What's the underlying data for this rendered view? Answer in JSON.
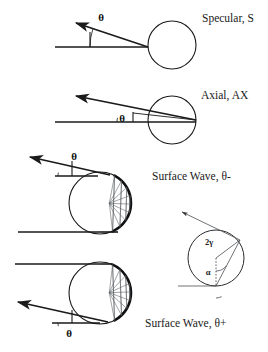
{
  "figure": {
    "background_color": "#ffffff",
    "ink_color": "#1a1a1a",
    "chord_color": "#555a5e",
    "width": 268,
    "height": 352
  },
  "panels": [
    {
      "id": "specular",
      "label": "Specular, S",
      "angle_label": "θ",
      "circle": {
        "cx": 172,
        "cy": 45,
        "r": 24
      },
      "label_pos": {
        "x": 202,
        "y": 22
      },
      "angle_label_pos": {
        "x": 101,
        "y": 21
      },
      "baseline": {
        "x1": 55,
        "y1": 47,
        "x2": 148,
        "y2": 47
      },
      "incident_ray": {
        "x1": 55,
        "y1": 47,
        "x2": 148,
        "y2": 47
      },
      "scattered_ray": {
        "x1": 148,
        "y1": 47,
        "x2": 76,
        "y2": 23
      },
      "angle_arc": {
        "cx": 148,
        "cy": 47,
        "r": 58,
        "start_deg": 180,
        "end_deg": 162
      },
      "vertical_tick": {
        "x1": 90,
        "y1": 47,
        "x2": 90,
        "y2": 32
      }
    },
    {
      "id": "axial",
      "label": "Axial, AX",
      "angle_label": "θ",
      "circle": {
        "cx": 172,
        "cy": 120,
        "r": 24
      },
      "label_pos": {
        "x": 201,
        "y": 99
      },
      "angle_label_pos": {
        "x": 122,
        "y": 122
      },
      "baseline": {
        "x1": 55,
        "y1": 122,
        "x2": 196,
        "y2": 122
      },
      "converge_point": {
        "x": 196,
        "y": 120
      },
      "scattered_ray": {
        "x1": 196,
        "y1": 120,
        "x2": 76,
        "y2": 96
      },
      "inner_ray": {
        "x1": 196,
        "y1": 120,
        "x2": 133,
        "y2": 113
      },
      "angle_arc": {
        "cx": 133,
        "cy": 122,
        "r": 16,
        "start_deg": 180,
        "end_deg": 165
      },
      "vertical_tick": {
        "x1": 133,
        "y1": 122,
        "x2": 133,
        "y2": 112
      }
    },
    {
      "id": "surface-wave-minus",
      "label": "Surface Wave, θ-",
      "angle_label": "θ",
      "circle": {
        "cx": 100,
        "cy": 203,
        "r": 31
      },
      "label_pos": {
        "x": 152,
        "y": 180
      },
      "angle_label_pos": {
        "x": 74,
        "y": 160
      },
      "baseline": {
        "x1": 18,
        "y1": 232,
        "x2": 100,
        "y2": 232
      },
      "entry_point": {
        "x": 118,
        "y": 232
      },
      "exit_point": {
        "x": 110,
        "y": 175
      },
      "scattered_ray": {
        "x1": 110,
        "y1": 175,
        "x2": 30,
        "y2": 157
      },
      "ref_line": {
        "x1": 55,
        "y1": 176,
        "x2": 98,
        "y2": 176
      },
      "vertical_tick": {
        "x1": 72,
        "y1": 176,
        "x2": 72,
        "y2": 161
      },
      "angle_arc": {
        "cx": 72,
        "cy": 176,
        "r": 14,
        "start_deg": 180,
        "end_deg": 166
      },
      "creep_arc": {
        "start_deg": 62,
        "end_deg": -66
      },
      "chord_count": 9
    },
    {
      "id": "surface-wave-plus",
      "label": "Surface Wave, θ+",
      "angle_label": "θ",
      "circle": {
        "cx": 100,
        "cy": 293,
        "r": 31
      },
      "label_pos": {
        "x": 145,
        "y": 327
      },
      "angle_label_pos": {
        "x": 69,
        "y": 337
      },
      "baseline": {
        "x1": 15,
        "y1": 264,
        "x2": 100,
        "y2": 264
      },
      "entry_point": {
        "x": 112,
        "y": 264
      },
      "exit_point": {
        "x": 108,
        "y": 322
      },
      "scattered_ray": {
        "x1": 108,
        "y1": 322,
        "x2": 18,
        "y2": 302
      },
      "ref_line": {
        "x1": 52,
        "y1": 323,
        "x2": 100,
        "y2": 323
      },
      "vertical_tick": {
        "x1": 72,
        "y1": 323,
        "x2": 72,
        "y2": 310
      },
      "angle_arc": {
        "cx": 72,
        "cy": 323,
        "r": 14,
        "start_deg": 180,
        "end_deg": 193
      },
      "creep_arc": {
        "start_deg": -62,
        "end_deg": 66
      },
      "chord_count": 9
    }
  ],
  "inset": {
    "id": "angle-definition-inset",
    "circle": {
      "cx": 216,
      "cy": 258,
      "r": 28
    },
    "gamma_label": "2γ",
    "alpha_label": "α",
    "gamma_label_pos": {
      "x": 209,
      "y": 245
    },
    "alpha_label_pos": {
      "x": 208,
      "y": 275
    },
    "ground_line": {
      "x1": 178,
      "y1": 286,
      "x2": 216,
      "y2": 286
    },
    "tangent_point": {
      "x": 216,
      "y": 286
    },
    "upper_point": {
      "x": 240,
      "y": 240
    },
    "exit_ray": {
      "x1": 240,
      "y1": 240,
      "x2": 182,
      "y2": 212
    },
    "chord": {
      "x1": 216,
      "y1": 286,
      "x2": 240,
      "y2": 240
    },
    "radius_line": {
      "x1": 216,
      "y1": 258,
      "x2": 240,
      "y2": 240
    },
    "dotted_vertical": {
      "x1": 216,
      "y1": 258,
      "x2": 216,
      "y2": 286
    },
    "gamma_arc": {
      "cx": 216,
      "cy": 258,
      "r": 13,
      "start_deg": -90,
      "end_deg": -37
    },
    "alpha_arc": {
      "cx": 216,
      "cy": 286,
      "r": 12,
      "start_deg": -90,
      "end_deg": -62
    }
  }
}
